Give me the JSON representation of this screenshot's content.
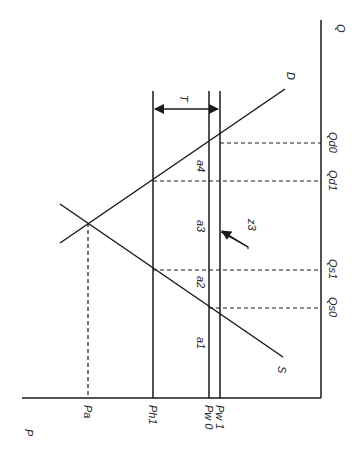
{
  "diagram": {
    "type": "supply-demand tariff diagram (rotated 90° clockwise)",
    "axes": {
      "price_axis_label": "P",
      "quantity_axis_label": "Q"
    },
    "curves": {
      "demand_label": "D",
      "supply_label": "S"
    },
    "price_levels": {
      "autarky": "Pa",
      "home_with_tariff": "Ph1",
      "world_initial": "Pw 0",
      "world_after": "Pw 1"
    },
    "quantities": {
      "qd0": "Qd0",
      "qd1": "Qd1",
      "qs1": "Qs1",
      "qs0": "Qs0"
    },
    "areas": {
      "a1": "a1",
      "a2": "a2",
      "a3": "a3",
      "a4": "a4",
      "z3": "z3"
    },
    "tariff_label": "T",
    "colors": {
      "line": "#1a1a1a",
      "background": "#ffffff"
    }
  }
}
